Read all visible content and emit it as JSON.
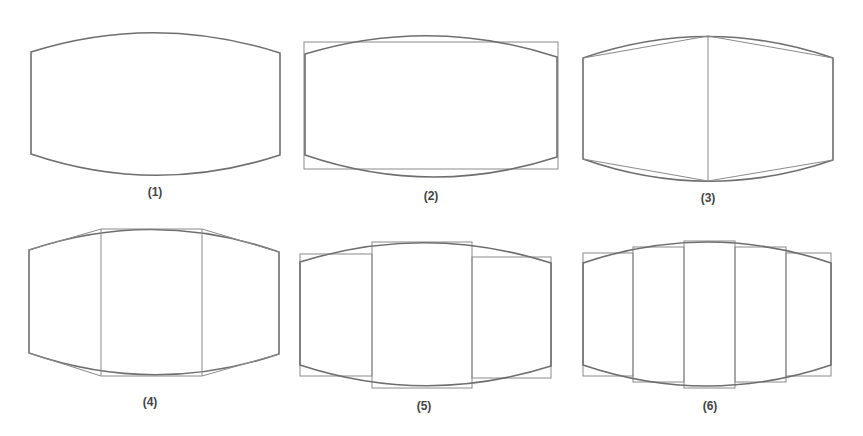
{
  "figure": {
    "panels": [
      {
        "id": 1,
        "label": "(1)",
        "segments": 0,
        "style": "curve only"
      },
      {
        "id": 2,
        "label": "(2)",
        "segments": 1,
        "style": "single bounding rectangle"
      },
      {
        "id": 3,
        "label": "(3)",
        "segments": 2,
        "style": "two trapezoids (polyline)"
      },
      {
        "id": 4,
        "label": "(4)",
        "segments": 3,
        "style": "three trapezoids (polyline)"
      },
      {
        "id": 5,
        "label": "(5)",
        "segments": 3,
        "style": "three rectangles"
      },
      {
        "id": 6,
        "label": "(6)",
        "segments": 5,
        "style": "five rectangles"
      }
    ]
  },
  "colors": {
    "curve": "#6e6e6e",
    "approximation": "#8a8a8a",
    "label": "#444444",
    "background": "#ffffff"
  }
}
